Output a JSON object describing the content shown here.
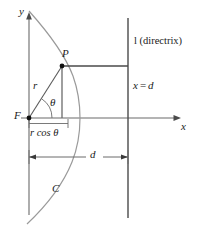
{
  "figure": {
    "canvas": {
      "width": 201,
      "height": 228
    },
    "colors": {
      "axis": "#6b6b6b",
      "curve": "#8a8a8a",
      "construction": "#6b6b6b",
      "directrix": "#4a4a4a",
      "text": "#1a1a1a",
      "background": "#ffffff"
    },
    "labels": {
      "y_axis": "y",
      "x_axis": "x",
      "focus": "F",
      "point": "P",
      "radius": "r",
      "angle": "θ",
      "curve": "C",
      "directrix_line": "l (directrix)",
      "directrix_eq_lhs": "x",
      "directrix_eq_rel": "=",
      "directrix_eq_rhs": "d",
      "projection": "r cos θ",
      "distance": "d"
    },
    "geometry": {
      "focus_point": {
        "x": 29,
        "y": 118
      },
      "point_p": {
        "x": 62,
        "y": 66
      },
      "vertex": {
        "x": 80,
        "y": 118
      },
      "directrix_x": 128,
      "x_axis_y": 118,
      "y_axis_x": 29,
      "x_axis_arrow_tip": 180,
      "y_axis_arrow_tip": 13,
      "dimension_line_y": 157,
      "projection_line_y": 128
    }
  }
}
